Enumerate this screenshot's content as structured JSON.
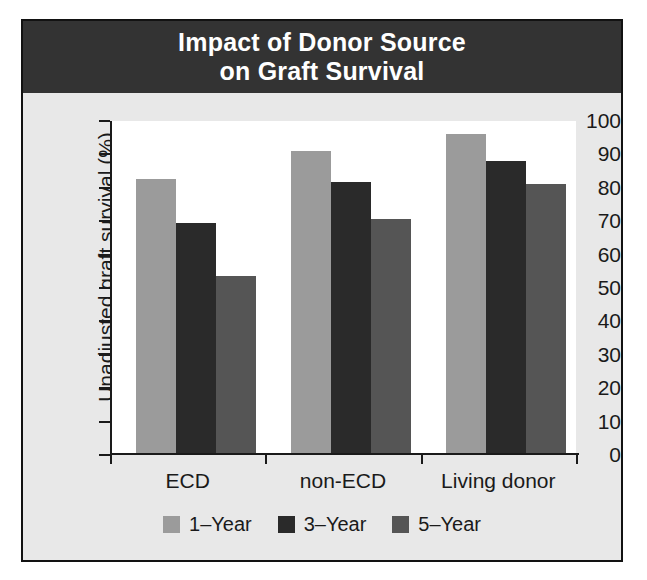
{
  "figure": {
    "title_line1": "Impact of Donor Source",
    "title_line2": "on Graft Survival"
  },
  "chart_data": {
    "type": "bar",
    "title": "Impact of Donor Source on Graft Survival",
    "xlabel": "",
    "ylabel": "Unadjusted graft survival (%)",
    "ylim": [
      0,
      100
    ],
    "yticks": [
      0,
      10,
      20,
      30,
      40,
      50,
      60,
      70,
      80,
      90,
      100
    ],
    "ytick_labels": [
      "0",
      "10",
      "20",
      "30",
      "40",
      "50",
      "60",
      "70",
      "80",
      "90",
      "100"
    ],
    "grid": false,
    "legend_position": "bottom",
    "categories": [
      "ECD",
      "non-ECD",
      "Living donor"
    ],
    "series": [
      {
        "name": "1–Year",
        "color": "#9b9b9b",
        "values": [
          82,
          90.5,
          95.5
        ]
      },
      {
        "name": "3–Year",
        "color": "#2a2a2a",
        "values": [
          69,
          81,
          87.5
        ]
      },
      {
        "name": "5–Year",
        "color": "#555555",
        "values": [
          53,
          70,
          80.5
        ]
      }
    ]
  },
  "colors": {
    "title_band": "#333333",
    "figure_background": "#e8e8e8",
    "plot_background": "#ffffff",
    "axis": "#1a1a1a"
  }
}
